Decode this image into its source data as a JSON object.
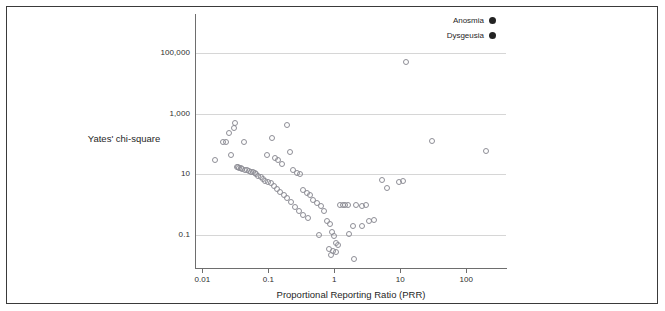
{
  "chart_data": {
    "type": "scatter",
    "title": "",
    "xlabel": "Proportional Reporting Ratio (PRR)",
    "ylabel": "Yates' chi-square",
    "xscale": "log",
    "yscale": "log",
    "xlim": [
      0.008,
      400
    ],
    "ylim": [
      0.008,
      2000000
    ],
    "xticks": [
      "0.01",
      "0.1",
      "1",
      "10",
      "100"
    ],
    "xtick_values": [
      0.01,
      0.1,
      1,
      10,
      100
    ],
    "yticks": [
      "0.1",
      "10",
      "1,000",
      "100,000"
    ],
    "ytick_values": [
      0.1,
      10,
      1000,
      100000
    ],
    "grid": "horizontal",
    "marker": "open-circle",
    "marker_color": "#8e8e96",
    "legend_position": "top-right",
    "series": [
      {
        "name": "Anosmia",
        "marker_color": "#232323",
        "points": [
          [
            0.0155,
            30
          ],
          [
            0.0205,
            120
          ],
          [
            0.0225,
            115
          ],
          [
            0.0255,
            230
          ],
          [
            0.0275,
            45
          ],
          [
            0.03,
            330
          ],
          [
            0.0315,
            500
          ],
          [
            0.033,
            18
          ],
          [
            0.0345,
            17
          ],
          [
            0.036,
            16
          ],
          [
            0.038,
            16
          ],
          [
            0.04,
            15
          ],
          [
            0.0425,
            120
          ],
          [
            0.045,
            14
          ],
          [
            0.048,
            14
          ],
          [
            0.051,
            13
          ],
          [
            0.0545,
            12
          ],
          [
            0.058,
            12
          ],
          [
            0.062,
            11
          ],
          [
            0.066,
            10
          ],
          [
            0.07,
            9
          ],
          [
            0.076,
            8
          ],
          [
            0.082,
            7
          ],
          [
            0.09,
            6
          ],
          [
            0.098,
            5.5
          ],
          [
            0.11,
            5
          ],
          [
            0.12,
            4
          ],
          [
            0.135,
            3.2
          ],
          [
            0.15,
            2.6
          ],
          [
            0.17,
            2.0
          ],
          [
            0.19,
            1.6
          ],
          [
            0.22,
            1.2
          ],
          [
            0.25,
            0.85
          ],
          [
            0.29,
            0.6
          ],
          [
            0.34,
            0.45
          ],
          [
            0.4,
            0.35
          ]
        ]
      },
      {
        "name": "Dysgeusia",
        "marker_color": "#232323",
        "points": [
          [
            0.095,
            45
          ],
          [
            0.115,
            160
          ],
          [
            0.125,
            35
          ],
          [
            0.14,
            30
          ],
          [
            0.16,
            22
          ],
          [
            0.19,
            420
          ],
          [
            0.21,
            55
          ],
          [
            0.24,
            14
          ],
          [
            0.27,
            11
          ],
          [
            0.3,
            10
          ],
          [
            0.34,
            3.0
          ],
          [
            0.38,
            2.4
          ],
          [
            0.43,
            2.0
          ],
          [
            0.48,
            1.4
          ],
          [
            0.54,
            1.1
          ],
          [
            0.62,
            0.9
          ],
          [
            0.7,
            0.6
          ],
          [
            0.78,
            0.28
          ],
          [
            0.86,
            0.23
          ],
          [
            0.92,
            0.12
          ],
          [
            0.98,
            0.09
          ],
          [
            1.05,
            0.055
          ],
          [
            1.12,
            0.045
          ],
          [
            0.82,
            0.035
          ],
          [
            0.95,
            0.03
          ],
          [
            1.05,
            0.028
          ],
          [
            0.88,
            0.022
          ],
          [
            2.0,
            0.016
          ],
          [
            1.2,
            1.0
          ],
          [
            1.35,
            1.0
          ],
          [
            1.45,
            0.95
          ],
          [
            1.6,
            1.0
          ],
          [
            2.1,
            1.0
          ],
          [
            2.6,
            0.9
          ],
          [
            3.0,
            0.95
          ],
          [
            1.9,
            0.2
          ],
          [
            2.6,
            0.2
          ],
          [
            3.3,
            0.28
          ],
          [
            4.0,
            0.3
          ],
          [
            0.58,
            0.1
          ],
          [
            1.65,
            0.11
          ],
          [
            5.2,
            6.5
          ],
          [
            6.3,
            3.6
          ],
          [
            9.5,
            5.5
          ],
          [
            11.0,
            5.8
          ],
          [
            12.0,
            50000
          ],
          [
            30.0,
            130
          ],
          [
            200.0,
            60
          ]
        ]
      }
    ],
    "legend": [
      {
        "label": "Anosmia",
        "color": "#232323"
      },
      {
        "label": "Dysgeusia",
        "color": "#232323"
      }
    ]
  }
}
